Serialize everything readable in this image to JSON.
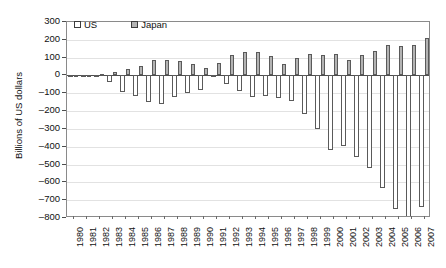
{
  "chart_data": {
    "type": "bar",
    "title": "",
    "xlabel": "",
    "ylabel": "Billions of US dollars",
    "ylim": [
      -800,
      300
    ],
    "ytick_values": [
      300,
      200,
      100,
      0,
      -100,
      -200,
      -300,
      -400,
      -500,
      -600,
      -700,
      -800
    ],
    "ytick_labels": [
      "300",
      "200",
      "100",
      "0",
      "–100",
      "–200",
      "–300",
      "–400",
      "–500",
      "–600",
      "–700",
      "–800"
    ],
    "grid": true,
    "legend_position": "top-left",
    "categories": [
      "1980",
      "1981",
      "1982",
      "1983",
      "1984",
      "1985",
      "1986",
      "1987",
      "1988",
      "1989",
      "1990",
      "1991",
      "1992",
      "1993",
      "1994",
      "1995",
      "1996",
      "1997",
      "1998",
      "1999",
      "2000",
      "2001",
      "2002",
      "2003",
      "2004",
      "2005",
      "2006",
      "2007"
    ],
    "series": [
      {
        "name": "US",
        "color": "#ffffff",
        "edge_color": "#5a5a5a",
        "values": [
          2,
          5,
          -6,
          -39,
          -94,
          -118,
          -147,
          -161,
          -121,
          -99,
          -79,
          3,
          -50,
          -85,
          -122,
          -114,
          -125,
          -141,
          -215,
          -301,
          -417,
          -398,
          -459,
          -522,
          -631,
          -749,
          -811,
          -738
        ]
      },
      {
        "name": "Japan",
        "color": "#b3b3b3",
        "edge_color": "#5a5a5a",
        "values": [
          -11,
          4,
          6,
          20,
          35,
          51,
          85,
          87,
          80,
          63,
          44,
          68,
          112,
          132,
          130,
          111,
          66,
          97,
          119,
          115,
          120,
          88,
          112,
          136,
          172,
          166,
          170,
          211
        ]
      }
    ]
  },
  "legend": {
    "items": [
      {
        "label": "US",
        "swatch": "white-square-swatch"
      },
      {
        "label": "Japan",
        "swatch": "gray-square-swatch"
      }
    ]
  }
}
